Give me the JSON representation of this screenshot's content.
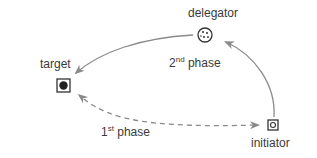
{
  "nodes": {
    "target": {
      "label": "target",
      "icon": "filled-circle-in-square"
    },
    "delegator": {
      "label": "delegator",
      "icon": "dotted-circle"
    },
    "initiator": {
      "label": "initiator",
      "icon": "hollow-circle-in-square"
    }
  },
  "edges": {
    "first": {
      "num": "1",
      "sup": "st",
      "text": " phase",
      "style": "dashed",
      "from": "initiator",
      "to": "target",
      "bidirectional": true
    },
    "second": {
      "num": "2",
      "sup": "nd",
      "text": " phase",
      "style": "solid",
      "path": "initiator -> delegator -> target"
    }
  },
  "colors": {
    "arrow": "#8a8a8a",
    "node": "#333333"
  }
}
